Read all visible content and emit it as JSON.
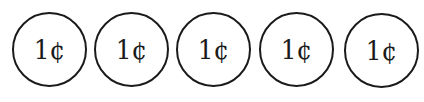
{
  "coins": [
    {
      "label": "1¢"
    },
    {
      "label": "1¢"
    },
    {
      "label": "1¢"
    },
    {
      "label": "1¢"
    },
    {
      "label": "1¢"
    }
  ]
}
